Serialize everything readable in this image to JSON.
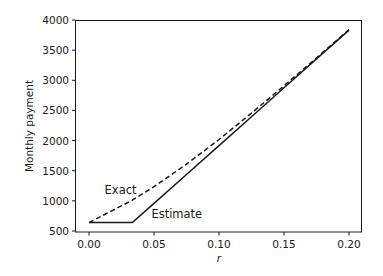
{
  "chart_data": {
    "type": "line",
    "title": "",
    "xlabel": "r",
    "ylabel": "Monthly payment",
    "xlim": [
      -0.01,
      0.21
    ],
    "ylim": [
      500,
      4000
    ],
    "xticks": [
      "0.00",
      "0.05",
      "0.10",
      "0.15",
      "0.20"
    ],
    "yticks": [
      "500",
      "1000",
      "1500",
      "2000",
      "2500",
      "3000",
      "3500",
      "4000"
    ],
    "grid": false,
    "legend": null,
    "annotations": [
      {
        "text": "Exact",
        "x": 0.012,
        "y": 1120
      },
      {
        "text": "Estimate",
        "x": 0.048,
        "y": 720
      }
    ],
    "x": [
      0.0,
      0.0333,
      0.05,
      0.075,
      0.1,
      0.125,
      0.15,
      0.175,
      0.2
    ],
    "series": [
      {
        "name": "Exact",
        "style": "dashed",
        "values": [
          639,
          1011,
          1235,
          1608,
          2018,
          2455,
          2908,
          3372,
          3843
        ]
      },
      {
        "name": "Estimate",
        "style": "solid",
        "values": [
          639,
          639,
          958,
          1438,
          1917,
          2396,
          2875,
          3354,
          3833
        ]
      }
    ]
  }
}
